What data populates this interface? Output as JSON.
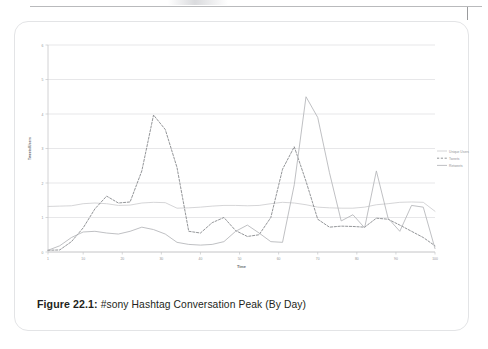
{
  "page": {
    "rule_present": true
  },
  "figure": {
    "caption_label": "Figure 22.1:",
    "caption_text": " #sony Hashtag Conversation Peak (By Day)"
  },
  "chart_data": {
    "type": "line",
    "title": "",
    "subtitle": "",
    "xlabel": "Time",
    "ylabel": "Tweets/Users",
    "grid": true,
    "legend_position": "right",
    "xlim": [
      1,
      100
    ],
    "ylim": [
      0,
      6
    ],
    "yticks": [
      0,
      1,
      2,
      3,
      4,
      5,
      6
    ],
    "ytick_labels": [
      "0",
      "1",
      "2",
      "3",
      "4",
      "5",
      "6"
    ],
    "xticks": [
      1,
      10,
      20,
      30,
      40,
      50,
      60,
      70,
      80,
      90,
      100
    ],
    "xtick_labels": [
      "1",
      "10",
      "20",
      "30",
      "40",
      "50",
      "60",
      "70",
      "80",
      "90",
      "100"
    ],
    "x": [
      1,
      4,
      7,
      10,
      13,
      16,
      19,
      22,
      25,
      28,
      31,
      34,
      37,
      40,
      43,
      46,
      49,
      52,
      55,
      58,
      61,
      64,
      67,
      70,
      73,
      76,
      79,
      82,
      85,
      88,
      91,
      94,
      97,
      100
    ],
    "series": [
      {
        "name": "Unique Users",
        "style": "solid",
        "color": "#cdced0",
        "values": [
          1.32,
          1.33,
          1.34,
          1.4,
          1.42,
          1.4,
          1.35,
          1.36,
          1.42,
          1.44,
          1.43,
          1.27,
          1.28,
          1.3,
          1.33,
          1.35,
          1.35,
          1.34,
          1.35,
          1.4,
          1.44,
          1.42,
          1.37,
          1.3,
          1.28,
          1.27,
          1.27,
          1.3,
          1.37,
          1.4,
          1.44,
          1.45,
          1.44,
          1.18
        ]
      },
      {
        "name": "Tweets",
        "style": "dashed",
        "color": "#808285",
        "values": [
          0.05,
          0.06,
          0.3,
          0.7,
          1.25,
          1.62,
          1.42,
          1.45,
          2.35,
          3.97,
          3.55,
          2.45,
          0.6,
          0.55,
          0.85,
          1.0,
          0.62,
          0.45,
          0.5,
          1.0,
          2.4,
          3.05,
          2.05,
          0.95,
          0.72,
          0.75,
          0.74,
          0.72,
          0.98,
          0.95,
          0.78,
          0.6,
          0.42,
          0.18
        ]
      },
      {
        "name": "Retweets",
        "style": "solid",
        "color": "#b4b5b8",
        "values": [
          0.05,
          0.18,
          0.42,
          0.58,
          0.6,
          0.55,
          0.52,
          0.6,
          0.72,
          0.65,
          0.52,
          0.28,
          0.22,
          0.2,
          0.22,
          0.3,
          0.6,
          0.78,
          0.55,
          0.3,
          0.28,
          1.95,
          4.5,
          3.9,
          2.3,
          0.9,
          1.08,
          0.7,
          2.35,
          0.98,
          0.6,
          1.35,
          1.3,
          0.1
        ]
      }
    ],
    "legend": [
      {
        "label": "Unique Users",
        "style": "solid",
        "color": "#cdced0"
      },
      {
        "label": "Tweets",
        "style": "dashed",
        "color": "#808285"
      },
      {
        "label": "Retweets",
        "style": "solid",
        "color": "#b4b5b8"
      }
    ]
  }
}
